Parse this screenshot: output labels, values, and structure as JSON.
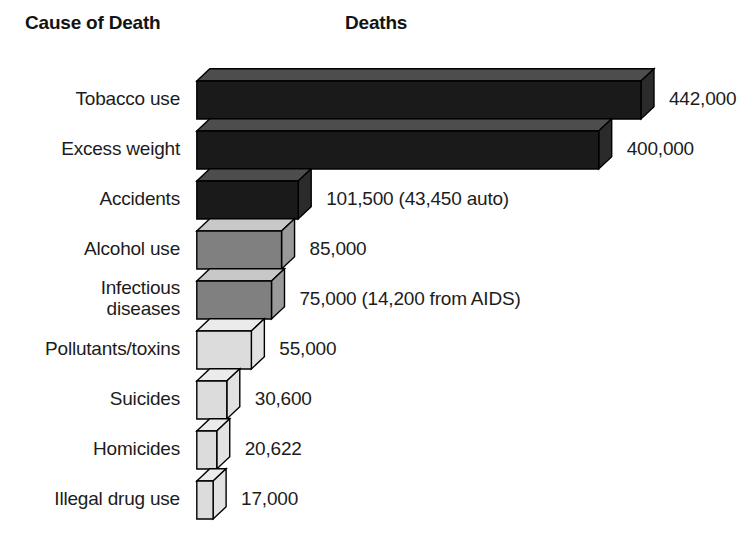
{
  "header": {
    "category_title": "Cause of Death",
    "value_title": "Deaths"
  },
  "chart_data": {
    "type": "bar",
    "orientation": "horizontal",
    "style": "3d-blocks",
    "title": "",
    "xlabel": "Deaths",
    "ylabel": "Cause of Death",
    "grid": false,
    "legend": null,
    "xlim": [
      0,
      442000
    ],
    "categories": [
      "Tobacco use",
      "Excess weight",
      "Accidents",
      "Alcohol use",
      "Infectious\ndiseases",
      "Pollutants/toxins",
      "Suicides",
      "Homicides",
      "Illegal drug use"
    ],
    "values": [
      442000,
      400000,
      101500,
      85000,
      75000,
      55000,
      30600,
      20622,
      17000
    ],
    "value_labels": [
      "442,000",
      "400,000",
      "101,500 (43,450 auto)",
      "85,000",
      "75,000 (14,200 from AIDS)",
      "55,000",
      "30,600",
      "20,622",
      "17,000"
    ],
    "bar_colors": [
      "#1a1a1a",
      "#1a1a1a",
      "#1a1a1a",
      "#808080",
      "#808080",
      "#dcdcdc",
      "#dcdcdc",
      "#dcdcdc",
      "#dcdcdc"
    ],
    "top_face_colors": [
      "#4d4d4d",
      "#4d4d4d",
      "#4d4d4d",
      "#c8c8c8",
      "#c8c8c8",
      "#ebebeb",
      "#ebebeb",
      "#ebebeb",
      "#ebebeb"
    ],
    "side_face_colors": [
      "#2b2b2b",
      "#2b2b2b",
      "#2b2b2b",
      "#9a9a9a",
      "#9a9a9a",
      "#e2e2e2",
      "#e2e2e2",
      "#e2e2e2",
      "#e2e2e2"
    ]
  },
  "colors": {
    "background": "#ffffff",
    "text": "#1c1c1c",
    "outline": "#000000"
  }
}
